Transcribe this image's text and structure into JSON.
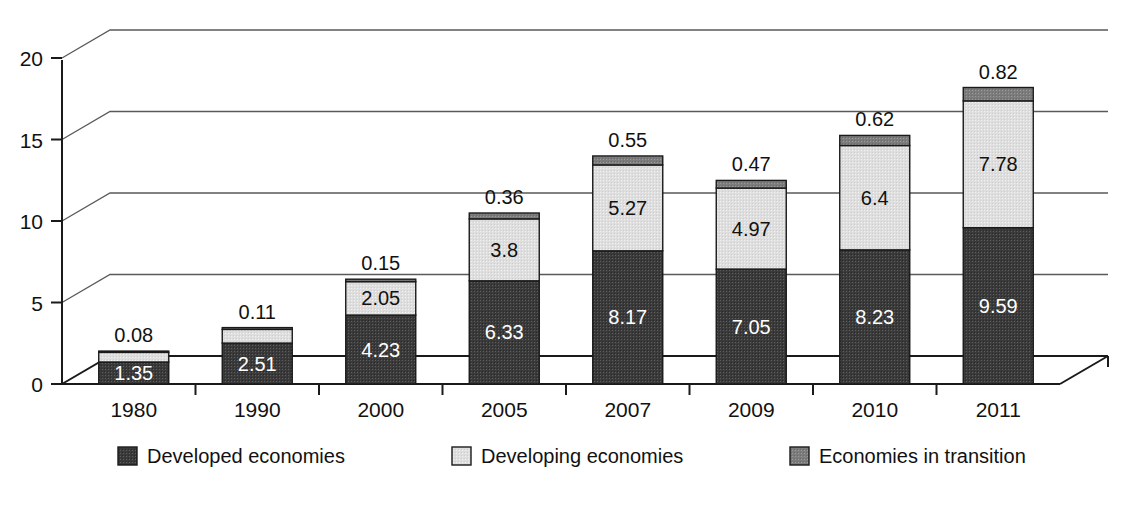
{
  "chart_data": {
    "type": "bar",
    "subtype": "stacked-bar-3d",
    "title": "",
    "xlabel": "",
    "ylabel": "",
    "ylim": [
      0,
      20
    ],
    "yticks": [
      0,
      5,
      10,
      15,
      20
    ],
    "ytick_labels": [
      "0",
      "5",
      "10",
      "15",
      "20"
    ],
    "grid": true,
    "grid_axis": "y",
    "legend_position": "bottom",
    "categories": [
      "1980",
      "1990",
      "2000",
      "2005",
      "2007",
      "2009",
      "2010",
      "2011"
    ],
    "series": [
      {
        "name": "Developed economies",
        "color": "#3c3c3c",
        "values": [
          1.35,
          2.51,
          4.23,
          6.33,
          8.17,
          7.05,
          8.23,
          9.59
        ],
        "labels": [
          "1.35",
          "2.51",
          "4.23",
          "6.33",
          "8.17",
          "7.05",
          "8.23",
          "9.59"
        ]
      },
      {
        "name": "Developing economies",
        "color": "#dcdcdc",
        "values": [
          0.59,
          0.84,
          2.05,
          3.8,
          5.27,
          4.97,
          6.4,
          7.78
        ],
        "labels": [
          "0.59",
          "0.84",
          "2.05",
          "3.8",
          "5.27",
          "4.97",
          "6.4",
          "7.78"
        ]
      },
      {
        "name": "Economies in transition",
        "color": "#7a7a7a",
        "values": [
          0.08,
          0.11,
          0.15,
          0.36,
          0.55,
          0.47,
          0.62,
          0.82
        ],
        "labels": [
          "0.08",
          "0.11",
          "0.15",
          "0.36",
          "0.55",
          "0.47",
          "0.62",
          "0.82"
        ]
      }
    ],
    "totals": [
      2.02,
      3.46,
      6.43,
      10.49,
      13.99,
      12.49,
      15.25,
      18.19
    ]
  },
  "legend": {
    "items": [
      {
        "label": "Developed economies",
        "swatch": "#3c3c3c"
      },
      {
        "label": "Developing economies",
        "swatch": "#dcdcdc"
      },
      {
        "label": "Economies in transition",
        "swatch": "#7a7a7a"
      }
    ]
  }
}
